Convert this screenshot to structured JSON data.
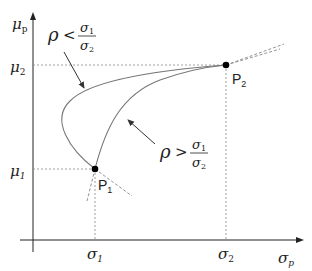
{
  "diagram": {
    "axes": {
      "y_label": "μ",
      "y_label_sub": "p",
      "x_label": "σ",
      "x_label_sub": "p"
    },
    "ticks": {
      "mu2": "μ",
      "mu2_sub": "2",
      "mu1": "μ",
      "mu1_sub": "1",
      "sigma1": "σ",
      "sigma1_sub": "1",
      "sigma2": "σ",
      "sigma2_sub": "2"
    },
    "points": {
      "p1": {
        "label": "P",
        "sub": "1"
      },
      "p2": {
        "label": "P",
        "sub": "2"
      }
    },
    "annotations": {
      "low_corr": {
        "rho": "ρ",
        "op": "<",
        "num": "σ",
        "num_sub": "1",
        "den": "σ",
        "den_sub": "2"
      },
      "high_corr": {
        "rho": "ρ",
        "op": ">",
        "num": "σ",
        "num_sub": "1",
        "den": "σ",
        "den_sub": "2"
      }
    },
    "colors": {
      "axis": "#222222",
      "curve": "#777777",
      "guide": "#888888",
      "point": "#000000"
    }
  }
}
